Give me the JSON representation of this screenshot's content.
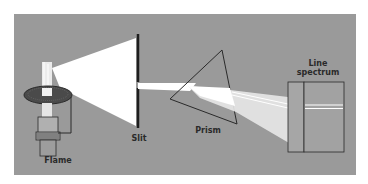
{
  "diagram": {
    "type": "optical-apparatus",
    "labels": {
      "flame": "Flame",
      "slit": "Slit",
      "prism": "Prism",
      "line_spectrum_1": "Line",
      "line_spectrum_2": "spectrum"
    },
    "colors": {
      "background": "#9a9a9a",
      "light": "#ffffff",
      "outline": "#2a2a2a"
    }
  }
}
